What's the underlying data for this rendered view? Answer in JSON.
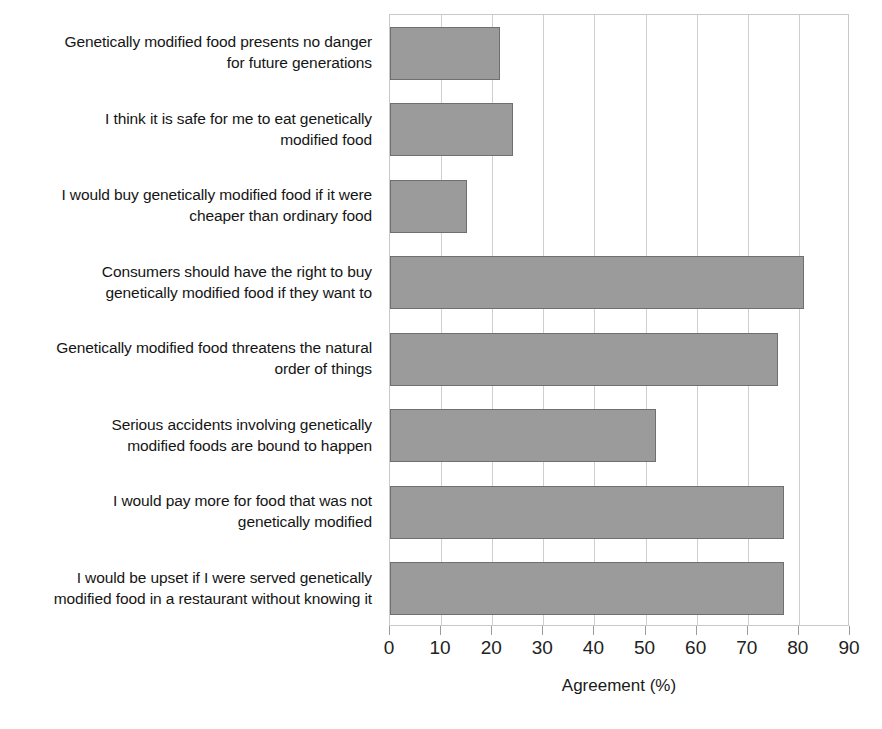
{
  "chart_data": {
    "type": "bar",
    "orientation": "horizontal",
    "title": "",
    "subtitle": "",
    "xlabel": "Agreement (%)",
    "ylabel": "",
    "xlim": [
      0,
      90
    ],
    "xticks": [
      0,
      10,
      20,
      30,
      40,
      50,
      60,
      70,
      80,
      90
    ],
    "xtick_labels": [
      "0",
      "10",
      "20",
      "30",
      "40",
      "50",
      "60",
      "70",
      "80",
      "90"
    ],
    "grid": true,
    "grid_axis": "x",
    "legend": false,
    "legend_position": "none",
    "bar_color": "#9b9b9b",
    "bar_edge_color": "#6f6f6f",
    "categories": [
      "Genetically modified food presents no danger for future generations",
      "I think it is safe for me to eat genetically modified food",
      "I would buy genetically modified food if it were cheaper than ordinary food",
      "Consumers should have the right to buy genetically modified food if they want to",
      "Genetically modified food threatens the natural order of things",
      "Serious accidents involving genetically modified foods are bound to happen",
      "I would pay more for food that was not genetically modified",
      "I would be upset if I were served genetically modified food in a restaurant without knowing it"
    ],
    "category_lines": [
      [
        "Genetically modified food presents no danger",
        "for future generations"
      ],
      [
        "I think it is safe for me to eat genetically",
        "modified food"
      ],
      [
        "I would buy genetically modified food if it were",
        "cheaper than ordinary food"
      ],
      [
        "Consumers should have the right to buy",
        "genetically modified food if they want to"
      ],
      [
        "Genetically modified food threatens the natural",
        "order of things"
      ],
      [
        "Serious accidents involving genetically",
        "modified foods are bound to happen"
      ],
      [
        "I would pay more for food that was not",
        "genetically modified"
      ],
      [
        "I would be upset if I were served genetically",
        "modified food in a restaurant without knowing it"
      ]
    ],
    "values": [
      21.5,
      24,
      15,
      81,
      76,
      52,
      77,
      77
    ]
  }
}
